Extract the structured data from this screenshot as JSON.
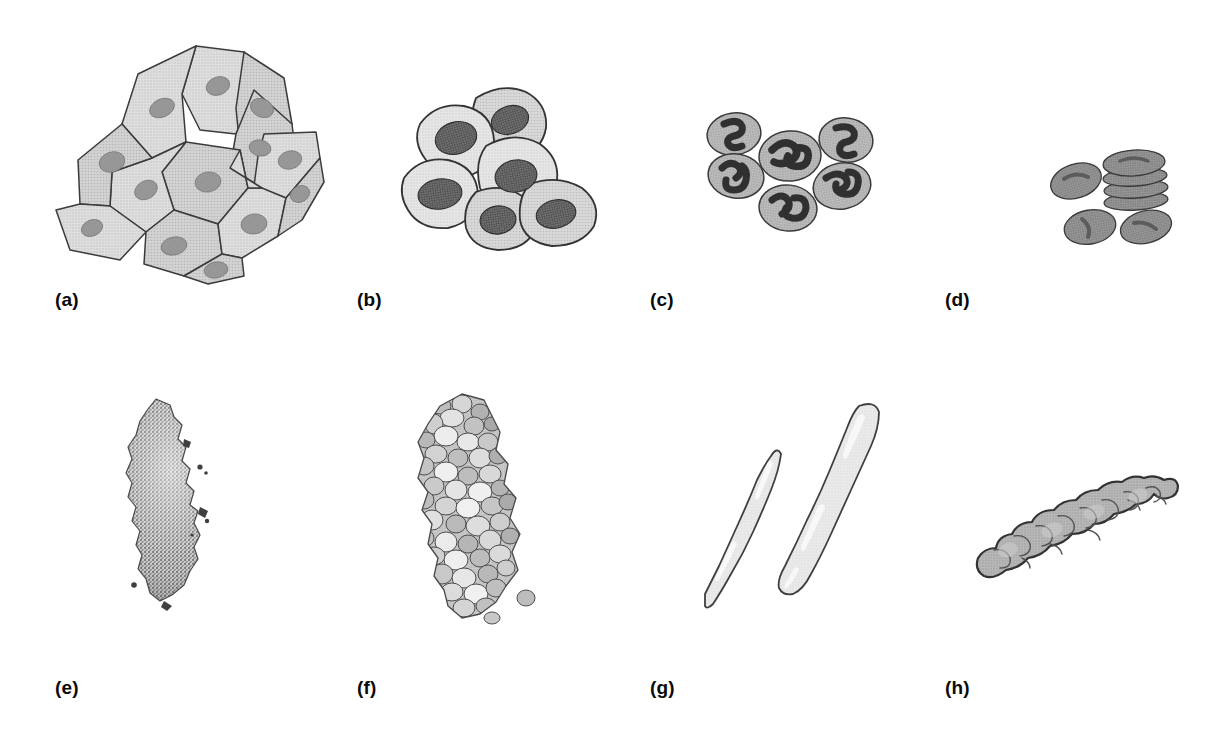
{
  "figure": {
    "background_color": "#ffffff",
    "width": 1214,
    "height": 748,
    "rows": 2,
    "columns": 4,
    "label_color": "#0a0a0a"
  },
  "palette": {
    "outline": "#3b3b3b",
    "outline_soft": "#5a5a5a",
    "cell_light": "#dcdcdc",
    "cell_pale": "#e4e4e4",
    "cell_mid": "#c6c6c6",
    "cell_mid_dark": "#b0b0b0",
    "cell_dark": "#9a9a9a",
    "nucleus_light": "#9c9c9c",
    "nucleus_dark": "#4a4a4a",
    "nucleus_very_dark": "#343434",
    "rbc_body": "#8d8d8d",
    "rbc_dimple": "#5e5e5e",
    "stipple_dark": "#6f6f6f",
    "stipple_light": "#cfcfcf",
    "highlight": "#f2f2f2"
  },
  "panels": [
    {
      "id": "a",
      "label": "(a)",
      "label_x": 55,
      "label_y": 298,
      "art_x": 48,
      "art_y": 38,
      "art_width": 280,
      "art_height": 250,
      "subject": "epithelial-cell-sheet",
      "description": "Confluent sheet of flattened polygonal epithelial cells with oval nuclei",
      "cell_count": 14,
      "fill": "#dcdcdc",
      "nucleus_fill": "#9c9c9c"
    },
    {
      "id": "b",
      "label": "(b)",
      "label_x": 357,
      "label_y": 298,
      "art_x": 398,
      "art_y": 80,
      "art_width": 225,
      "art_height": 175,
      "subject": "rounded-cell-cluster",
      "description": "Cluster of six large rounded cells with prominent mottled nuclei",
      "cell_count": 6,
      "fill": "#e2e2e2",
      "nucleus_fill": "#4a4a4a"
    },
    {
      "id": "c",
      "label": "(c)",
      "label_x": 650,
      "label_y": 298,
      "art_x": 700,
      "art_y": 110,
      "art_width": 185,
      "art_height": 125,
      "subject": "polymorphonuclear-granulocytes",
      "description": "Six round granulocytes with dark multilobed segmented nuclei",
      "cell_count": 6,
      "fill": "#b6b6b6",
      "nucleus_fill": "#343434"
    },
    {
      "id": "d",
      "label": "(d)",
      "label_x": 945,
      "label_y": 298,
      "art_x": 1048,
      "art_y": 143,
      "art_width": 130,
      "art_height": 105,
      "subject": "erythrocytes",
      "description": "Biconcave erythrocytes with central pale dimple plus a rouleaux stack of four discs",
      "cell_count": 7,
      "stack_count": 4,
      "fill": "#8d8d8d",
      "nucleus_fill": "none"
    },
    {
      "id": "e",
      "label": "(e)",
      "label_x": 55,
      "label_y": 686,
      "art_x": 112,
      "art_y": 395,
      "art_width": 130,
      "art_height": 215,
      "subject": "stippled-tissue-mass",
      "description": "Elongated stippled granular mass with ragged outline and detached specks",
      "fill": "#8c8c8c",
      "texture": "stipple"
    },
    {
      "id": "f",
      "label": "(f)",
      "label_x": 357,
      "label_y": 686,
      "art_x": 400,
      "art_y": 392,
      "art_width": 160,
      "art_height": 230,
      "subject": "packed-cell-aggregate",
      "description": "Same elongated mass resolved into many overlapping rounded cells",
      "cell_count": 120,
      "fill": "#c6c6c6",
      "texture": "cells"
    },
    {
      "id": "g",
      "label": "(g)",
      "label_x": 650,
      "label_y": 686,
      "art_x": 705,
      "art_y": 398,
      "art_width": 180,
      "art_height": 225,
      "subject": "elongated-fibre-cells",
      "description": "Two long smooth pale tapering fibre-like cells lying side by side",
      "cell_count": 2,
      "fill": "#e8e8e8"
    },
    {
      "id": "h",
      "label": "(h)",
      "label_x": 945,
      "label_y": 686,
      "art_x": 968,
      "art_y": 470,
      "art_width": 215,
      "art_height": 130,
      "subject": "lobulated-mass",
      "description": "Diagonal lumpy lobulated mass with bulbous cauliflower-like outline",
      "fill": "#b0b0b0"
    }
  ]
}
